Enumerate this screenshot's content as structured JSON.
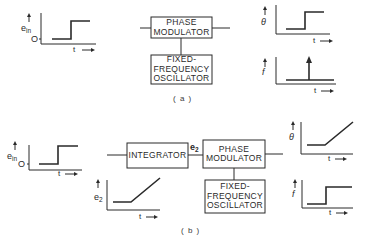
{
  "figure": {
    "panel_a": {
      "caption": "( a )",
      "blocks": {
        "phase_modulator": "PHASE\nMODULATOR",
        "oscillator": "FIXED-\nFREQUENCY\nOSCILLATOR"
      },
      "plots": {
        "input": {
          "ylabel": "e",
          "ylabel_sub": "in",
          "origin": "O",
          "xlabel": "t",
          "shape": "step"
        },
        "theta": {
          "ylabel": "θ",
          "xlabel": "t",
          "shape": "step"
        },
        "freq": {
          "ylabel": "f",
          "xlabel": "t",
          "shape": "impulse"
        }
      }
    },
    "panel_b": {
      "caption": "( b )",
      "signal_label": "e",
      "signal_label_sub": "2",
      "blocks": {
        "integrator": "INTEGRATOR",
        "phase_modulator": "PHASE\nMODULATOR",
        "oscillator": "FIXED-\nFREQUENCY\nOSCILLATOR"
      },
      "plots": {
        "input": {
          "ylabel": "e",
          "ylabel_sub": "in",
          "origin": "O",
          "xlabel": "t",
          "shape": "step"
        },
        "e2": {
          "ylabel": "e",
          "ylabel_sub": "2",
          "xlabel": "t",
          "shape": "ramp"
        },
        "theta": {
          "ylabel": "θ",
          "xlabel": "t",
          "shape": "ramp"
        },
        "freq": {
          "ylabel": "f",
          "xlabel": "t",
          "shape": "step"
        }
      }
    }
  },
  "arrow_glyph": "→"
}
